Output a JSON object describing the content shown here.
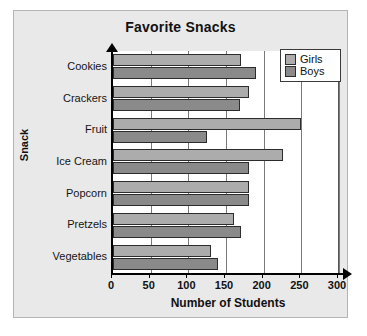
{
  "chart_data": {
    "type": "bar",
    "orientation": "horizontal",
    "title": "Favorite Snacks",
    "xlabel": "Number of Students",
    "ylabel": "Snack",
    "categories": [
      "Cookies",
      "Crackers",
      "Fruit",
      "Ice Cream",
      "Popcorn",
      "Pretzels",
      "Vegetables"
    ],
    "series": [
      {
        "name": "Girls",
        "color": "#acacac",
        "values": [
          170,
          180,
          250,
          225,
          180,
          160,
          130
        ]
      },
      {
        "name": "Boys",
        "color": "#8a8a8a",
        "values": [
          190,
          168,
          125,
          180,
          180,
          170,
          140
        ]
      }
    ],
    "xlim": [
      0,
      300
    ],
    "xticks": [
      0,
      50,
      100,
      150,
      200,
      250,
      300
    ],
    "xtick_labels": [
      "0",
      "50",
      "100",
      "150",
      "200",
      "250",
      "300"
    ],
    "grid": true,
    "grid_axis": "x",
    "legend_position": "top-right"
  },
  "legend": {
    "entries": [
      {
        "label": "Girls"
      },
      {
        "label": "Boys"
      }
    ]
  }
}
